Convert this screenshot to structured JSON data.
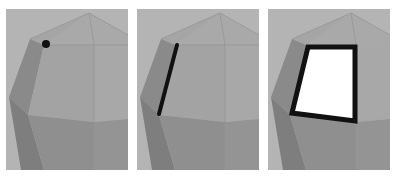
{
  "figure": {
    "panels": [
      {
        "id": "vertex",
        "highlight": "vertex",
        "marker_color": "#111111"
      },
      {
        "id": "edge",
        "highlight": "edge",
        "marker_color": "#111111"
      },
      {
        "id": "face",
        "highlight": "face",
        "marker_color": "#111111",
        "fill_color": "#ffffff"
      }
    ],
    "colors": {
      "background": "#b4b4b4",
      "top_facets": "#a9a9a9",
      "left_facets": "#8a8a8a",
      "front_facets": "#a2a2a2",
      "lower_facets": "#8d8d8d",
      "edges": "#959595"
    }
  }
}
